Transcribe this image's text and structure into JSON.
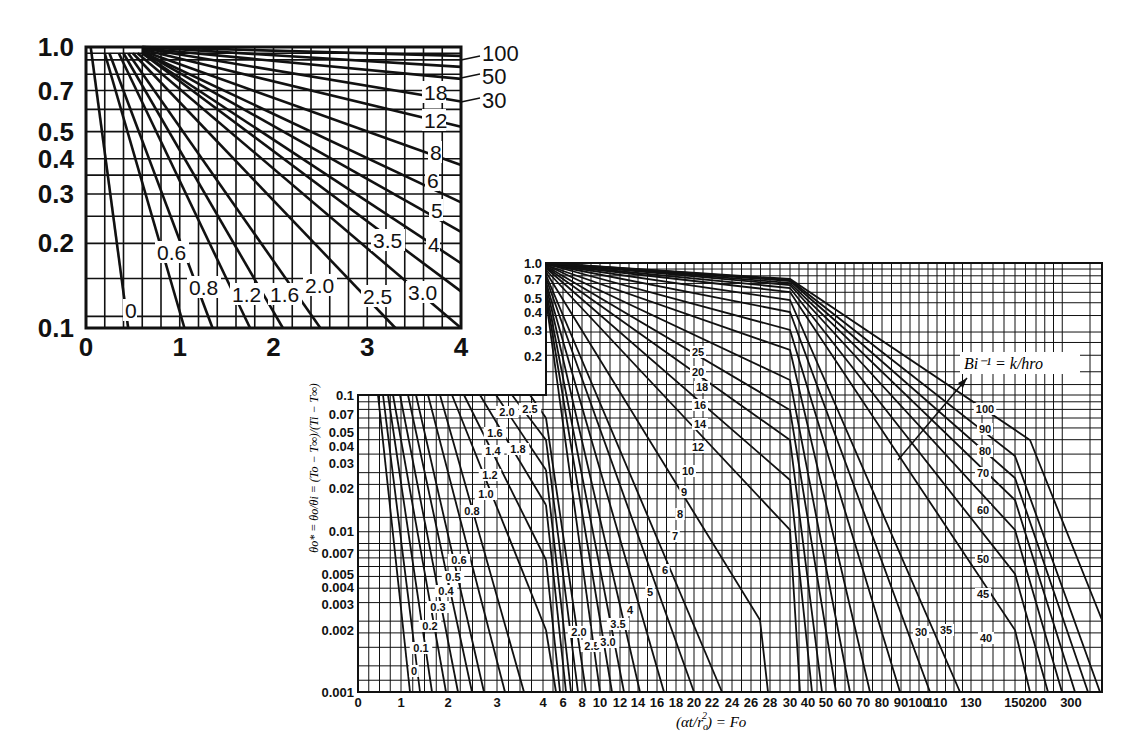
{
  "chart_data": [
    {
      "type": "line",
      "title": "",
      "description": "Inset: center temperature of infinite cylinder, early-time expanded scale",
      "xlabel": "",
      "ylabel": "",
      "xlim": [
        0,
        4
      ],
      "ylim": [
        0.1,
        1.0
      ],
      "yscale": "log",
      "grid": true,
      "x_ticks": [
        "0",
        "1",
        "2",
        "3",
        "4"
      ],
      "y_ticks": [
        "1.0",
        "0.7",
        "0.5",
        "0.4",
        "0.3",
        "0.2",
        "0.1"
      ],
      "curve_labels": [
        "0",
        "0.6",
        "0.8",
        "1.2",
        "1.6",
        "2.0",
        "2.5",
        "3.0",
        "3.5",
        "4",
        "5",
        "6",
        "8",
        "12",
        "18",
        "30",
        "50",
        "100"
      ],
      "series": [
        {
          "name": "0",
          "x": [
            0.05,
            0.45
          ],
          "y": [
            1.0,
            0.1
          ]
        },
        {
          "name": "0.6",
          "x": [
            0.2,
            1.05
          ],
          "y": [
            0.95,
            0.1
          ]
        },
        {
          "name": "0.8",
          "x": [
            0.25,
            1.35
          ],
          "y": [
            0.95,
            0.1
          ]
        },
        {
          "name": "1.2",
          "x": [
            0.35,
            1.75
          ],
          "y": [
            0.95,
            0.1
          ]
        },
        {
          "name": "1.6",
          "x": [
            0.4,
            2.1
          ],
          "y": [
            0.95,
            0.1
          ]
        },
        {
          "name": "2.0",
          "x": [
            0.45,
            2.5
          ],
          "y": [
            0.95,
            0.1
          ]
        },
        {
          "name": "2.5",
          "x": [
            0.5,
            3.3
          ],
          "y": [
            0.95,
            0.1
          ]
        },
        {
          "name": "3.0",
          "x": [
            0.55,
            4.0
          ],
          "y": [
            0.95,
            0.1
          ]
        },
        {
          "name": "3.5",
          "x": [
            0.6,
            4.0
          ],
          "y": [
            0.95,
            0.135
          ]
        },
        {
          "name": "4",
          "x": [
            0.6,
            4.0
          ],
          "y": [
            0.95,
            0.17
          ]
        },
        {
          "name": "5",
          "x": [
            0.6,
            4.0
          ],
          "y": [
            0.96,
            0.22
          ]
        },
        {
          "name": "6",
          "x": [
            0.6,
            4.0
          ],
          "y": [
            0.96,
            0.28
          ]
        },
        {
          "name": "8",
          "x": [
            0.6,
            4.0
          ],
          "y": [
            0.97,
            0.38
          ]
        },
        {
          "name": "12",
          "x": [
            0.6,
            4.0
          ],
          "y": [
            0.98,
            0.52
          ]
        },
        {
          "name": "18",
          "x": [
            0.6,
            4.0
          ],
          "y": [
            0.99,
            0.64
          ]
        },
        {
          "name": "30",
          "x": [
            0.6,
            4.0
          ],
          "y": [
            0.99,
            0.77
          ]
        },
        {
          "name": "50",
          "x": [
            0.6,
            4.0
          ],
          "y": [
            1.0,
            0.85
          ]
        },
        {
          "name": "100",
          "x": [
            0.6,
            4.0
          ],
          "y": [
            1.0,
            0.93
          ]
        }
      ]
    },
    {
      "type": "line",
      "title": "",
      "description": "Heisler chart: centerline temperature of infinite cylinder",
      "xlabel": "(αt/r_o²) = Fo",
      "ylabel": "θ_o* = θ_o/θ_i = (T_o − T_∞)/(T_i − T_∞)",
      "annotation": "Bi⁻¹ = k/hr_o",
      "yscale": "log",
      "ylim": [
        0.001,
        1.0
      ],
      "grid": true,
      "x_ticks": [
        "0",
        "1",
        "2",
        "3",
        "4",
        "6",
        "8",
        "10",
        "12",
        "14",
        "16",
        "18",
        "20",
        "22",
        "24",
        "26",
        "28",
        "30",
        "40",
        "50",
        "60",
        "70",
        "80",
        "90",
        "100",
        "110",
        "130",
        "150",
        "200",
        "300"
      ],
      "y_ticks": [
        "1.0",
        "0.7",
        "0.5",
        "0.4",
        "0.3",
        "0.2",
        "0.1",
        "0.07",
        "0.05",
        "0.04",
        "0.03",
        "0.02",
        "0.01",
        "0.007",
        "0.005",
        "0.004",
        "0.003",
        "0.002",
        "0.001"
      ],
      "curve_labels": [
        "0",
        "0.1",
        "0.2",
        "0.3",
        "0.4",
        "0.5",
        "0.6",
        "0.8",
        "1.0",
        "1.2",
        "1.4",
        "1.6",
        "1.8",
        "2.0",
        "2.5",
        "2.0",
        "2.5",
        "3.0",
        "3.5",
        "4",
        "5",
        "6",
        "7",
        "8",
        "9",
        "10",
        "12",
        "14",
        "16",
        "18",
        "20",
        "25",
        "30",
        "35",
        "40",
        "45",
        "50",
        "60",
        "70",
        "80",
        "90",
        "100"
      ],
      "series_note": "Bi^-1 parameter; curves are piecewise linear on log scale with scale breaks at Fo = 4, 30 and 150"
    }
  ],
  "inset": {
    "x_ticks": [
      "0",
      "1",
      "2",
      "3",
      "4"
    ],
    "y_ticks": [
      "1.0",
      "0.7",
      "0.5",
      "0.4",
      "0.3",
      "0.2",
      "0.1"
    ],
    "right_labels": [
      "100",
      "50",
      "30"
    ],
    "inner_labels": [
      {
        "t": "18",
        "x": 424,
        "y": 100
      },
      {
        "t": "12",
        "x": 424,
        "y": 128
      },
      {
        "t": "8",
        "x": 430,
        "y": 160
      },
      {
        "t": "6",
        "x": 427,
        "y": 188
      },
      {
        "t": "5",
        "x": 431,
        "y": 218
      },
      {
        "t": "4",
        "x": 428,
        "y": 252
      },
      {
        "t": "3.5",
        "x": 373,
        "y": 248
      },
      {
        "t": "0.6",
        "x": 157,
        "y": 260
      },
      {
        "t": "0.8",
        "x": 189,
        "y": 295
      },
      {
        "t": "1.2",
        "x": 232,
        "y": 302
      },
      {
        "t": "1.6",
        "x": 270,
        "y": 302
      },
      {
        "t": "2.0",
        "x": 305,
        "y": 293
      },
      {
        "t": "2.5",
        "x": 363,
        "y": 304
      },
      {
        "t": "3.0",
        "x": 408,
        "y": 300
      },
      {
        "t": "0",
        "x": 125,
        "y": 318
      }
    ]
  },
  "main": {
    "y_ticks": [
      {
        "t": "1.0",
        "y": 263
      },
      {
        "t": "0.7",
        "y": 279
      },
      {
        "t": "0.5",
        "y": 298
      },
      {
        "t": "0.4",
        "y": 312
      },
      {
        "t": "0.3",
        "y": 330
      },
      {
        "t": "0.2",
        "y": 356
      },
      {
        "t": "0.1",
        "y": 395
      },
      {
        "t": "0.07",
        "y": 414
      },
      {
        "t": "0.05",
        "y": 432
      },
      {
        "t": "0.04",
        "y": 446
      },
      {
        "t": "0.03",
        "y": 463
      },
      {
        "t": "0.02",
        "y": 488
      },
      {
        "t": "0.01",
        "y": 531
      },
      {
        "t": "0.007",
        "y": 553
      },
      {
        "t": "0.005",
        "y": 574
      },
      {
        "t": "0.004",
        "y": 587
      },
      {
        "t": "0.003",
        "y": 604
      },
      {
        "t": "0.002",
        "y": 630
      },
      {
        "t": "0.001",
        "y": 692
      }
    ],
    "x_ticks": [
      {
        "t": "0",
        "x": 358
      },
      {
        "t": "1",
        "x": 401
      },
      {
        "t": "2",
        "x": 448
      },
      {
        "t": "3",
        "x": 497
      },
      {
        "t": "4",
        "x": 543
      },
      {
        "t": "6",
        "x": 563
      },
      {
        "t": "8",
        "x": 582
      },
      {
        "t": "10",
        "x": 600
      },
      {
        "t": "12",
        "x": 620
      },
      {
        "t": "14",
        "x": 638
      },
      {
        "t": "16",
        "x": 657
      },
      {
        "t": "18",
        "x": 676
      },
      {
        "t": "20",
        "x": 694
      },
      {
        "t": "22",
        "x": 712
      },
      {
        "t": "24",
        "x": 732
      },
      {
        "t": "26",
        "x": 751
      },
      {
        "t": "28",
        "x": 770
      },
      {
        "t": "30",
        "x": 790
      },
      {
        "t": "40",
        "x": 808
      },
      {
        "t": "50",
        "x": 826
      },
      {
        "t": "60",
        "x": 845
      },
      {
        "t": "70",
        "x": 863
      },
      {
        "t": "80",
        "x": 882
      },
      {
        "t": "90",
        "x": 901
      },
      {
        "t": "100",
        "x": 919
      },
      {
        "t": "110",
        "x": 937
      },
      {
        "t": "130",
        "x": 971
      },
      {
        "t": "150",
        "x": 1015
      },
      {
        "t": "200",
        "x": 1036
      },
      {
        "t": "300",
        "x": 1071
      }
    ],
    "xlabel": "(αt/r",
    "xlabel_sub": "o",
    "xlabel_sup": "2",
    "xlabel_tail": ") = Fo",
    "ylabel": "θo* = θo/θi = (To − T∞)/(Ti − T∞)",
    "annotation": "Bi⁻¹ = k/hro",
    "curve_labels": [
      {
        "t": "0",
        "x": 414,
        "y": 675
      },
      {
        "t": "0.1",
        "x": 421,
        "y": 652
      },
      {
        "t": "0.2",
        "x": 430,
        "y": 630
      },
      {
        "t": "0.3",
        "x": 438,
        "y": 611
      },
      {
        "t": "0.4",
        "x": 446,
        "y": 595
      },
      {
        "t": "0.5",
        "x": 453,
        "y": 581
      },
      {
        "t": "0.6",
        "x": 459,
        "y": 564
      },
      {
        "t": "0.8",
        "x": 472,
        "y": 515
      },
      {
        "t": "1.0",
        "x": 486,
        "y": 498
      },
      {
        "t": "1.2",
        "x": 490,
        "y": 479
      },
      {
        "t": "1.4",
        "x": 493,
        "y": 455
      },
      {
        "t": "1.6",
        "x": 495,
        "y": 437
      },
      {
        "t": "1.8",
        "x": 518,
        "y": 453
      },
      {
        "t": "2.0",
        "x": 507,
        "y": 416
      },
      {
        "t": "2.5",
        "x": 530,
        "y": 413
      },
      {
        "t": "2.0",
        "x": 579,
        "y": 636
      },
      {
        "t": "2.5",
        "x": 592,
        "y": 650
      },
      {
        "t": "3.0",
        "x": 608,
        "y": 646
      },
      {
        "t": "3.5",
        "x": 618,
        "y": 628
      },
      {
        "t": "4",
        "x": 630,
        "y": 614
      },
      {
        "t": "5",
        "x": 650,
        "y": 596
      },
      {
        "t": "6",
        "x": 665,
        "y": 574
      },
      {
        "t": "7",
        "x": 675,
        "y": 540
      },
      {
        "t": "8",
        "x": 680,
        "y": 518
      },
      {
        "t": "9",
        "x": 684,
        "y": 496
      },
      {
        "t": "10",
        "x": 688,
        "y": 475
      },
      {
        "t": "12",
        "x": 698,
        "y": 451
      },
      {
        "t": "14",
        "x": 700,
        "y": 428
      },
      {
        "t": "16",
        "x": 700,
        "y": 409
      },
      {
        "t": "18",
        "x": 702,
        "y": 391
      },
      {
        "t": "20",
        "x": 698,
        "y": 376
      },
      {
        "t": "25",
        "x": 698,
        "y": 356
      },
      {
        "t": "30",
        "x": 921,
        "y": 636
      },
      {
        "t": "35",
        "x": 946,
        "y": 634
      },
      {
        "t": "40",
        "x": 986,
        "y": 642
      },
      {
        "t": "45",
        "x": 983,
        "y": 598
      },
      {
        "t": "50",
        "x": 983,
        "y": 563
      },
      {
        "t": "60",
        "x": 983,
        "y": 514
      },
      {
        "t": "70",
        "x": 983,
        "y": 477
      },
      {
        "t": "80",
        "x": 985,
        "y": 455
      },
      {
        "t": "90",
        "x": 985,
        "y": 433
      },
      {
        "t": "100",
        "x": 985,
        "y": 413
      }
    ]
  }
}
